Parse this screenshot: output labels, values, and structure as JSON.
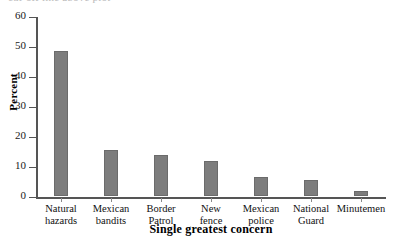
{
  "chart_data": {
    "type": "bar",
    "title": "",
    "xlabel": "Single greatest concern",
    "ylabel": "Percent",
    "categories": [
      "Natural hazards",
      "Mexican bandits",
      "Border Patrol",
      "New fence",
      "Mexican police",
      "National Guard",
      "Minutemen"
    ],
    "category_lines": [
      [
        "Natural",
        "hazards"
      ],
      [
        "Mexican",
        "bandits"
      ],
      [
        "Border",
        "Patrol"
      ],
      [
        "New",
        "fence"
      ],
      [
        "Mexican",
        "police"
      ],
      [
        "National",
        "Guard"
      ],
      [
        "Minutemen",
        ""
      ]
    ],
    "values": [
      48.5,
      15.3,
      13.8,
      11.8,
      6.2,
      5.5,
      1.8
    ],
    "ylim": [
      0,
      60
    ],
    "yticks": [
      0,
      10,
      20,
      30,
      40,
      50,
      60
    ],
    "ytick_labels": [
      "0",
      "10",
      "20",
      "30",
      "40",
      "50",
      "60"
    ],
    "grid": false,
    "legend": false,
    "bar_color": "#7d7d7d",
    "bar_edge_color": "#6b6b6b",
    "axis_color": "#555555"
  },
  "artifacts": {
    "cropped_top_text": "cut-off line above plot"
  }
}
